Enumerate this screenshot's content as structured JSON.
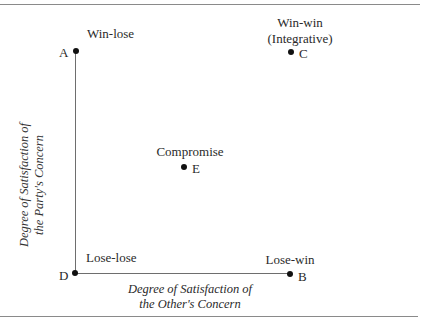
{
  "diagram": {
    "title": "",
    "points": {
      "A": {
        "letter": "A",
        "label": "Win-lose"
      },
      "B": {
        "letter": "B",
        "label": "Lose-win"
      },
      "C": {
        "letter": "C",
        "label_line1": "Win-win",
        "label_line2": "(Integrative)"
      },
      "D": {
        "letter": "D",
        "label": "Lose-lose"
      },
      "E": {
        "letter": "E",
        "label": "Compromise"
      }
    },
    "y_axis": {
      "line1": "Degree of Satisfaction of",
      "line2": "the Party's Concern"
    },
    "x_axis": {
      "line1": "Degree of Satisfaction of",
      "line2": "the Other's Concern"
    }
  }
}
